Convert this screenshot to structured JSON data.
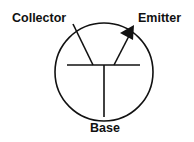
{
  "diagram": {
    "type": "transistor-symbol",
    "labels": {
      "collector": "Collector",
      "emitter": "Emitter",
      "base": "Base"
    },
    "stroke_color": "#111111",
    "background": "#ffffff"
  }
}
